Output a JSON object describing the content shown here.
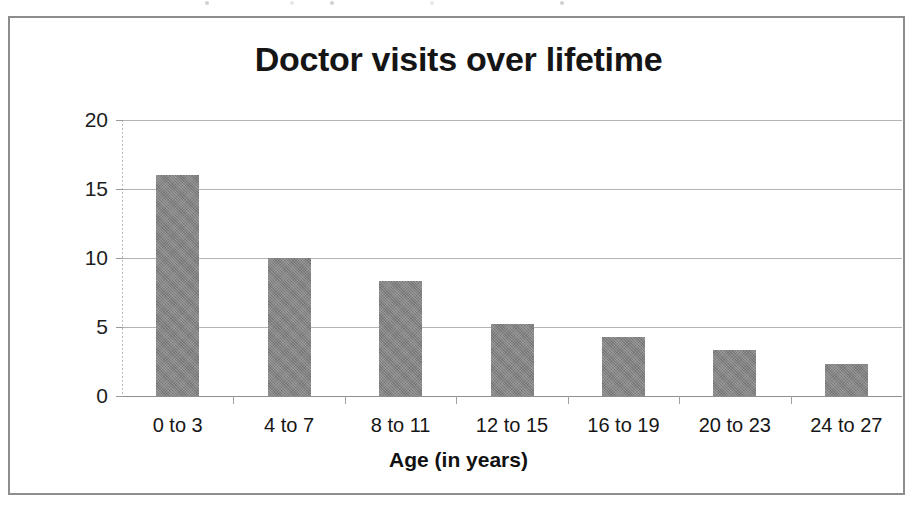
{
  "figure": {
    "frame_border_color": "#8d8d8d",
    "background": "#ffffff"
  },
  "chart_data": {
    "type": "bar",
    "title": "Doctor visits over lifetime",
    "xlabel": "Age (in years)",
    "ylabel": "Total number of doctor visits",
    "categories": [
      "0 to 3",
      "4 to 7",
      "8 to 11",
      "12 to 15",
      "16 to 19",
      "20 to 23",
      "24 to 27"
    ],
    "values": [
      16,
      10,
      8.3,
      5.2,
      4.3,
      3.3,
      2.3
    ],
    "ylim": [
      0,
      20
    ],
    "yticks": [
      0,
      5,
      10,
      15,
      20
    ],
    "ytick_labels": [
      "0",
      "5",
      "10",
      "15",
      "20"
    ],
    "grid": true,
    "grid_axis": "y",
    "grid_color": "#b4b4b4",
    "legend": false,
    "bar_color": "#828282",
    "bar_edge_color": "#6f6f6f"
  }
}
